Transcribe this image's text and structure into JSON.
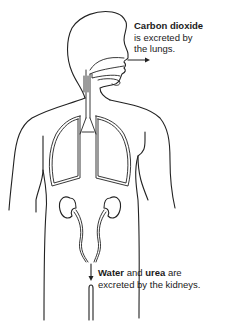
{
  "diagram": {
    "stroke_color": "#222222",
    "background": "#ffffff",
    "labels": {
      "lungs": {
        "bold": "Carbon dioxide",
        "line1_rest": "",
        "line2": "is excreted by",
        "line3": "the lungs."
      },
      "kidneys": {
        "bold1": "Water",
        "mid": " and ",
        "bold2": "urea",
        "rest": " are",
        "line2": "excreted by the kidneys."
      }
    },
    "arrows": [
      {
        "name": "co2-out-arrow",
        "direction": "right",
        "from": "nose"
      },
      {
        "name": "urine-out-arrow",
        "direction": "down",
        "from": "ureters"
      }
    ],
    "organs": [
      "head",
      "nasal-cavity",
      "trachea",
      "lungs",
      "kidneys",
      "ureters",
      "urethra"
    ]
  }
}
